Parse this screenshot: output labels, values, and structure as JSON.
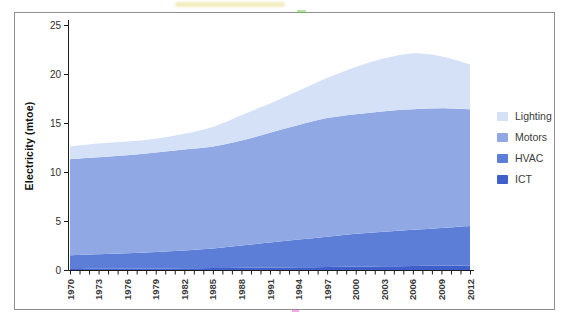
{
  "figure": {
    "y_axis_title": "Electricity (mtoe)",
    "legend": [
      {
        "label": "Lighting",
        "color": "#d4e1f6"
      },
      {
        "label": "Motors",
        "color": "#90a8e4"
      },
      {
        "label": "HVAC",
        "color": "#5d7ed7"
      },
      {
        "label": "ICT",
        "color": "#3f60cb"
      }
    ]
  },
  "chart_data": {
    "type": "area",
    "stacked": true,
    "title": "",
    "xlabel": "",
    "ylabel": "Electricity (mtoe)",
    "ylim": [
      0,
      25
    ],
    "yticks": [
      0,
      5,
      10,
      15,
      20,
      25
    ],
    "x": [
      1970,
      1973,
      1976,
      1979,
      1982,
      1985,
      1988,
      1991,
      1994,
      1997,
      2000,
      2003,
      2006,
      2009,
      2012
    ],
    "xtick_labels": [
      "1970",
      "1973",
      "1976",
      "1979",
      "1982",
      "1985",
      "1988",
      "1991",
      "1994",
      "1997",
      "2000",
      "2003",
      "2006",
      "2009",
      "2012"
    ],
    "xtick_label_rotation_deg": -90,
    "minor_xticks_every_year": true,
    "grid": false,
    "legend_position": "right",
    "stack_order_bottom_to_top": [
      "ICT",
      "HVAC",
      "Motors",
      "Lighting"
    ],
    "series": [
      {
        "name": "Lighting",
        "color": "#d4e1f6",
        "values": [
          1.3,
          1.4,
          1.4,
          1.4,
          1.6,
          2.0,
          2.6,
          3.0,
          3.5,
          4.1,
          4.8,
          5.4,
          5.7,
          5.3,
          4.6
        ]
      },
      {
        "name": "Motors",
        "color": "#90a8e4",
        "values": [
          9.8,
          9.9,
          10.0,
          10.15,
          10.3,
          10.4,
          10.7,
          11.2,
          11.7,
          12.1,
          12.2,
          12.3,
          12.3,
          12.2,
          11.9
        ]
      },
      {
        "name": "HVAC",
        "color": "#5d7ed7",
        "values": [
          1.4,
          1.48,
          1.56,
          1.69,
          1.82,
          2.0,
          2.27,
          2.54,
          2.81,
          3.08,
          3.34,
          3.51,
          3.68,
          3.86,
          4.05
        ]
      },
      {
        "name": "ICT",
        "color": "#3f60cb",
        "values": [
          0.1,
          0.12,
          0.14,
          0.16,
          0.18,
          0.2,
          0.23,
          0.26,
          0.29,
          0.32,
          0.36,
          0.39,
          0.42,
          0.44,
          0.45
        ]
      }
    ],
    "totals_note": "stacked totals rise from ~12.6 mtoe (1970) to a peak of ~22.1 mtoe (~2006), ending ~21.0 mtoe (2012)"
  }
}
